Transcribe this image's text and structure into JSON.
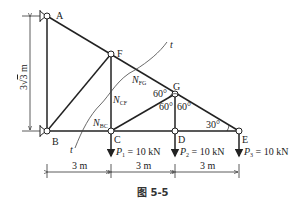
{
  "figure": {
    "caption": "图 5-5",
    "nodes": {
      "A": "A",
      "B": "B",
      "C": "C",
      "D": "D",
      "E": "E",
      "F": "F",
      "G": "G"
    },
    "dimensions": {
      "height": "3√3 m",
      "height_prefix": "3",
      "height_root": "3",
      "height_unit": "m",
      "spans": [
        "3 m",
        "3 m",
        "3 m"
      ]
    },
    "forces": {
      "N_FG": {
        "main": "N",
        "sub": "FG"
      },
      "N_CF": {
        "main": "N",
        "sub": "CF"
      },
      "N_BC": {
        "main": "N",
        "sub": "BC"
      }
    },
    "loads": [
      {
        "main": "P",
        "sub": "1",
        "value": " = 10 kN"
      },
      {
        "main": "P",
        "sub": "2",
        "value": " = 10 kN"
      },
      {
        "main": "P",
        "sub": "3",
        "value": " = 10 kN"
      }
    ],
    "angles": {
      "g_left": "60°",
      "g_bottom_left": "60°",
      "g_bottom_right": "60°",
      "e": "30°"
    },
    "section_label": "t",
    "section_label_2": "t"
  }
}
